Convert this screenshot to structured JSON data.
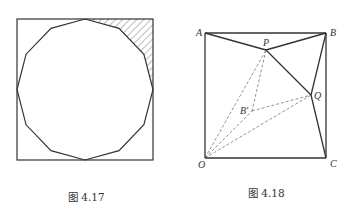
{
  "figures": [
    {
      "id": "fig-4-17",
      "caption": "图 4.17",
      "description": "Regular dodecagon inscribed in a square; region between the polygon and the top-right corner of the square is hatched",
      "square": {
        "x": 17,
        "y": 19,
        "width": 136,
        "height": 141
      },
      "polygon": {
        "sides": 12,
        "center": [
          85,
          89.5
        ],
        "rx": 68,
        "ry": 70.5
      },
      "hatched_region": "top-right corner between polygon and square"
    },
    {
      "id": "fig-4-18",
      "caption": "图 4.18",
      "points": {
        "A": {
          "label": "A",
          "x": 205,
          "y": 33
        },
        "B": {
          "label": "B",
          "x": 326,
          "y": 33
        },
        "C": {
          "label": "C",
          "x": 326,
          "y": 158
        },
        "O": {
          "label": "O",
          "x": 205,
          "y": 158
        },
        "P": {
          "label": "P",
          "x": 266,
          "y": 50
        },
        "Q": {
          "label": "Q",
          "x": 311,
          "y": 95
        },
        "Bp": {
          "label": "B'",
          "x": 252,
          "y": 111
        }
      },
      "solid_segments": [
        [
          "A",
          "B"
        ],
        [
          "B",
          "C"
        ],
        [
          "C",
          "O"
        ],
        [
          "O",
          "A"
        ],
        [
          "A",
          "P"
        ],
        [
          "P",
          "B"
        ],
        [
          "P",
          "Q"
        ],
        [
          "B",
          "Q"
        ],
        [
          "Q",
          "C"
        ]
      ],
      "dashed_segments": [
        [
          "O",
          "P"
        ],
        [
          "P",
          "Bp"
        ],
        [
          "O",
          "Bp"
        ],
        [
          "Bp",
          "Q"
        ],
        [
          "O",
          "Q"
        ]
      ]
    }
  ]
}
